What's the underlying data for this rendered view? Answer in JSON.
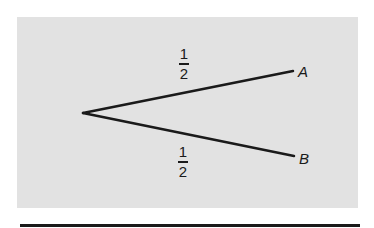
{
  "diagram": {
    "type": "probability-tree",
    "root": {
      "x": 83,
      "y": 113
    },
    "branches": [
      {
        "to": "A",
        "probability": {
          "numerator": "1",
          "denominator": "2"
        },
        "end": {
          "x": 293,
          "y": 71
        }
      },
      {
        "to": "B",
        "probability": {
          "numerator": "1",
          "denominator": "2"
        },
        "end": {
          "x": 294,
          "y": 156
        }
      }
    ],
    "labels": {
      "a": "A",
      "b": "B"
    },
    "colors": {
      "panel": "#e2e2e2",
      "ink": "#1a1a1a"
    }
  }
}
